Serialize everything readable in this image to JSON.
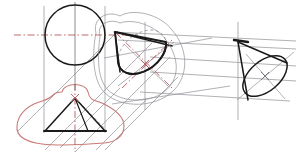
{
  "document": {
    "title": "Descriptive Geometry Construction — Cone Auxiliary Views",
    "type": "technical-line-drawing",
    "canvas": {
      "width": 296,
      "height": 165,
      "background": "#ffffff"
    }
  },
  "colors": {
    "object_line": "#1a1a1a",
    "construction_line": "#8f8f96",
    "center_line": "#b5595b",
    "sketch_outline": "#c87b78",
    "hidden_line": "#9a9aa2",
    "background": "#ffffff"
  },
  "views": {
    "top_view": {
      "label": "top-view-circle",
      "center": {
        "x": 75,
        "y": 35
      },
      "radius": 30,
      "has_center_lines": true,
      "center_line_color": "#b5595b"
    },
    "front_view": {
      "label": "front-view-triangle",
      "apex": {
        "x": 75,
        "y": 98
      },
      "base_left": {
        "x": 45,
        "y": 131
      },
      "base_right": {
        "x": 105,
        "y": 131
      },
      "has_sketch_outline": true,
      "sketch_color": "#c87b78"
    },
    "auxiliary_view_1": {
      "label": "auxiliary-cone-middle",
      "apex": {
        "x": 115,
        "y": 32
      },
      "ellipse_center": {
        "x": 145,
        "y": 64
      },
      "ellipse_rx": 27,
      "ellipse_ry": 18,
      "ellipse_rotation": -38,
      "has_sketch_outline": true
    },
    "auxiliary_view_2": {
      "label": "auxiliary-cone-right",
      "apex": {
        "x": 238,
        "y": 42
      },
      "ellipse_center": {
        "x": 265,
        "y": 76
      },
      "ellipse_rx": 26,
      "ellipse_ry": 15,
      "ellipse_rotation": -40
    }
  },
  "construction": {
    "vertical_lines_x": [
      44,
      75,
      105
    ],
    "projector_note": "parallel projector lines link top, front and auxiliary views",
    "parallel_band_count": 4
  },
  "annotations": {
    "caption": ""
  }
}
